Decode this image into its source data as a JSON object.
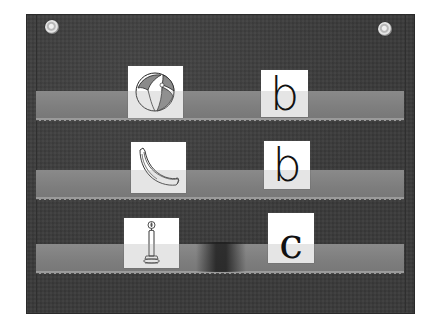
{
  "scene": {
    "description": "Black pocket chart with three clear pockets holding picture cards and letter cards",
    "colors": {
      "chart_fabric": "#3a3a3a",
      "pocket_strip": "#828282",
      "card": "#ffffff",
      "ink": "#111111"
    }
  },
  "pocket_chart": {
    "grommets": [
      "left-grommet",
      "right-grommet"
    ],
    "rows": [
      {
        "picture": {
          "icon": "beach-ball-icon",
          "label": "beach ball"
        },
        "letter": "b"
      },
      {
        "picture": {
          "icon": "banana-icon",
          "label": "banana"
        },
        "letter": "b"
      },
      {
        "picture": {
          "icon": "candle-icon",
          "label": "candle"
        },
        "letter": "c"
      }
    ]
  }
}
